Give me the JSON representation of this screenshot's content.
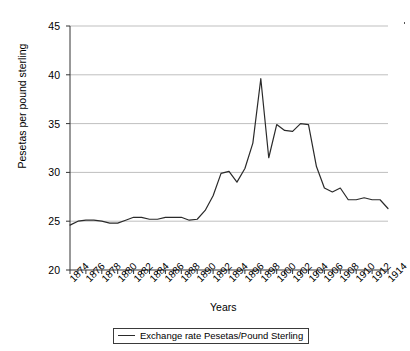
{
  "chart_data": {
    "type": "line",
    "title": "",
    "xlabel": "Years",
    "ylabel": "Pesetas per pound sterling",
    "ylim": [
      20,
      45
    ],
    "xlim": [
      1874,
      1914
    ],
    "yticks": [
      20,
      25,
      30,
      35,
      40,
      45
    ],
    "xticks": [
      1874,
      1876,
      1878,
      1880,
      1882,
      1884,
      1886,
      1888,
      1890,
      1892,
      1894,
      1896,
      1898,
      1900,
      1902,
      1904,
      1906,
      1908,
      1910,
      1912,
      1914
    ],
    "grid": "horizontal",
    "legend_position": "bottom",
    "line_color": "#2a2a2a",
    "grid_color": "#bfbfbf",
    "series": [
      {
        "name": "Exchange rate Pesetas/Pound Sterling",
        "x": [
          1874,
          1875,
          1876,
          1877,
          1878,
          1879,
          1880,
          1881,
          1882,
          1883,
          1884,
          1885,
          1886,
          1887,
          1888,
          1889,
          1890,
          1891,
          1892,
          1893,
          1894,
          1895,
          1896,
          1897,
          1898,
          1899,
          1900,
          1901,
          1902,
          1903,
          1904,
          1905,
          1906,
          1907,
          1908,
          1909,
          1910,
          1911,
          1912,
          1913,
          1914
        ],
        "values": [
          24.6,
          25.0,
          25.1,
          25.1,
          25.0,
          24.8,
          24.8,
          25.1,
          25.4,
          25.4,
          25.2,
          25.2,
          25.4,
          25.4,
          25.4,
          25.1,
          25.2,
          26.1,
          27.6,
          29.9,
          30.1,
          29.0,
          30.4,
          33.0,
          39.6,
          31.5,
          34.9,
          34.3,
          34.2,
          35.0,
          34.9,
          30.6,
          28.4,
          28.0,
          28.4,
          27.2,
          27.2,
          27.4,
          27.2,
          27.2,
          26.3
        ]
      }
    ],
    "annotations": []
  },
  "legend": {
    "label": "Exchange rate Pesetas/Pound Sterling"
  },
  "axes": {
    "x_title": "Years",
    "y_title": "Pesetas per pound sterling"
  }
}
